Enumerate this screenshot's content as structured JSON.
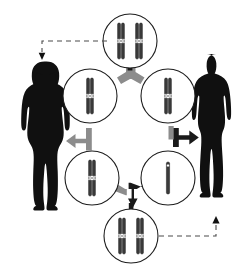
{
  "diagram": {
    "canvas": {
      "width": 251,
      "height": 276
    },
    "colors": {
      "silhouette": "#101010",
      "chromosome_dark": "#3a3a3a",
      "chromosome_outline": "#1a1a1a",
      "centromere": "#ffffff",
      "circle_outline": "#1d1d1d",
      "connector_gray": "#8c8c8c",
      "connector_dark": "#1a1a1a",
      "dashed_arrow": "#4a4a4a",
      "background": "#ffffff"
    },
    "figures": [
      {
        "id": "female-silhouette",
        "label": "Female",
        "side": "left",
        "cx": 45,
        "cy": 140
      },
      {
        "id": "male-silhouette",
        "label": "Male",
        "side": "right",
        "cx": 216,
        "cy": 137
      }
    ],
    "cells": [
      {
        "id": "cell-top",
        "position": "top",
        "cx": 130,
        "cy": 41,
        "r": 27,
        "stage_label": "Zygote / diploid cell",
        "chromosomes": [
          {
            "type": "duplicated",
            "x": -9,
            "length": 34,
            "centromere_offset": 2
          },
          {
            "type": "duplicated",
            "x": 9,
            "length": 34,
            "centromere_offset": 2
          }
        ]
      },
      {
        "id": "cell-upper-left",
        "position": "upper-left",
        "cx": 90,
        "cy": 96,
        "r": 27,
        "stage_label": "Haploid cell (duplicated chromosome)",
        "chromosomes": [
          {
            "type": "duplicated",
            "x": 0,
            "length": 36,
            "centromere_offset": 0
          }
        ]
      },
      {
        "id": "cell-upper-right",
        "position": "upper-right",
        "cx": 168,
        "cy": 96,
        "r": 27,
        "stage_label": "Haploid cell (duplicated chromosome)",
        "chromosomes": [
          {
            "type": "duplicated",
            "x": 0,
            "length": 36,
            "centromere_offset": 0
          }
        ]
      },
      {
        "id": "cell-lower-left",
        "position": "lower-left",
        "cx": 92,
        "cy": 178,
        "r": 27,
        "stage_label": "Haploid cell (duplicated chromosome)",
        "chromosomes": [
          {
            "type": "duplicated",
            "x": 0,
            "length": 36,
            "centromere_offset": 0
          }
        ]
      },
      {
        "id": "cell-lower-right",
        "position": "lower-right",
        "cx": 168,
        "cy": 178,
        "r": 27,
        "stage_label": "Gamete (single chromatid)",
        "chromosomes": [
          {
            "type": "single",
            "x": 0,
            "length": 32,
            "centromere_offset": -14
          }
        ]
      },
      {
        "id": "cell-bottom",
        "position": "bottom",
        "cx": 131,
        "cy": 236,
        "r": 27,
        "stage_label": "Zygote / diploid cell",
        "chromosomes": [
          {
            "type": "duplicated",
            "x": -9,
            "length": 32,
            "centromere_offset": 0
          },
          {
            "type": "duplicated",
            "x": 9,
            "length": 32,
            "centromere_offset": 0
          }
        ]
      }
    ],
    "connectors": [
      {
        "id": "connector-top",
        "shape": "tri-split",
        "cx": 130,
        "cy": 76,
        "rotation": 0,
        "color": "gray",
        "label": "division arrow top"
      },
      {
        "id": "connector-left",
        "shape": "tee-left",
        "cx": 79,
        "cy": 139,
        "rotation": 0,
        "color": "gray",
        "label": "division arrow left"
      },
      {
        "id": "connector-right",
        "shape": "tee-right",
        "cx": 180,
        "cy": 139,
        "rotation": 0,
        "color": "dark",
        "label": "division arrow right"
      },
      {
        "id": "connector-bottom",
        "shape": "tri-merge",
        "cx": 131,
        "cy": 203,
        "rotation": 180,
        "color": "mixed",
        "label": "division arrow bottom"
      }
    ],
    "dashed_arrows": [
      {
        "id": "arrow-top-to-female",
        "from": "cell-top",
        "to": "female-silhouette",
        "path": "M 108 41 L 42 41 L 42 53",
        "arrow_at": {
          "x": 42,
          "y": 60,
          "direction": "down"
        }
      },
      {
        "id": "arrow-bottom-to-male",
        "from": "cell-bottom",
        "to": "male-silhouette",
        "path": "M 159 236 L 216 236 L 216 224",
        "arrow_at": {
          "x": 216,
          "y": 217,
          "direction": "up"
        }
      }
    ]
  }
}
